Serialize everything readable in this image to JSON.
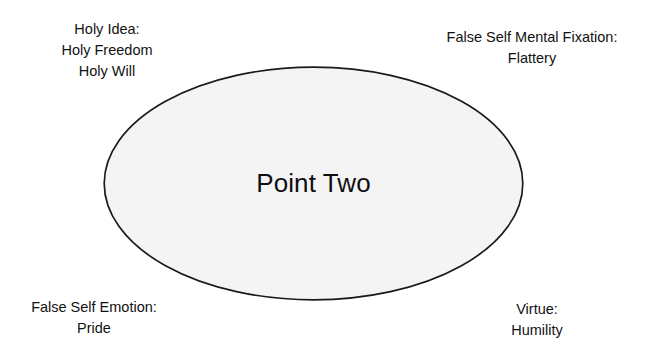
{
  "diagram": {
    "background_color": "#ffffff",
    "shape": {
      "type": "ellipse",
      "name": "point-two-ellipse",
      "label": "Point Two",
      "fill_color": "#f4f4f5",
      "stroke_color": "#1a1a1a"
    },
    "annotations": [
      {
        "id": "holy-idea",
        "position": "top-left",
        "lines": [
          "Holy Idea:",
          "Holy Freedom",
          "Holy Will"
        ]
      },
      {
        "id": "false-self-mental-fixation",
        "position": "top-right",
        "lines": [
          "False Self Mental Fixation:",
          "Flattery"
        ]
      },
      {
        "id": "false-self-emotion",
        "position": "bottom-left",
        "lines": [
          "False Self Emotion:",
          "Pride"
        ]
      },
      {
        "id": "virtue",
        "position": "bottom-right",
        "lines": [
          "Virtue:",
          "Humility"
        ]
      }
    ]
  }
}
